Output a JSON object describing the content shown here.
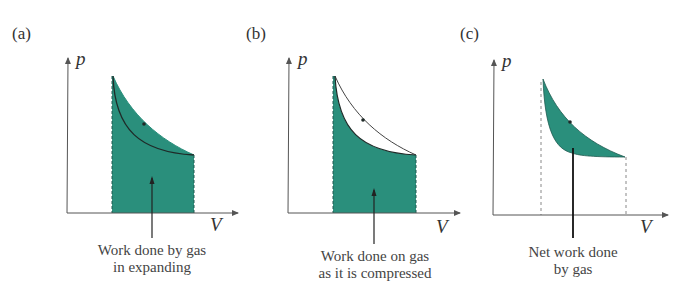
{
  "colors": {
    "fill": "#2a8f7c",
    "line": "#1f2a28",
    "axis": "#555555",
    "background": "#ffffff"
  },
  "panels": [
    {
      "label": "(a)",
      "y_axis": "p",
      "x_axis": "V",
      "caption_line1": "Work done by gas",
      "caption_line2": "in expanding"
    },
    {
      "label": "(b)",
      "y_axis": "p",
      "x_axis": "V",
      "caption_line1": "Work done on gas",
      "caption_line2": "as it is compressed"
    },
    {
      "label": "(c)",
      "y_axis": "p",
      "x_axis": "V",
      "caption_line1": "Net work done",
      "caption_line2": "by gas"
    }
  ]
}
